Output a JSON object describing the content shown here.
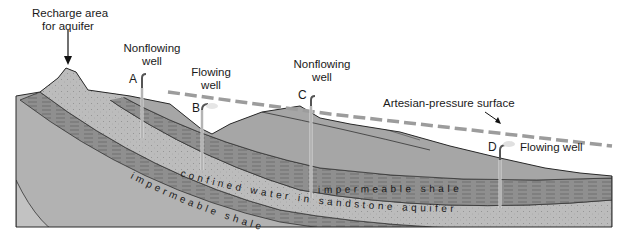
{
  "labels": {
    "recharge": "Recharge area for aquifer",
    "recharge_line1": "Recharge area",
    "recharge_line2": "for aquifer",
    "well_a_title_1": "Nonflowing",
    "well_a_title_2": "well",
    "well_b_title_1": "Flowing",
    "well_b_title_2": "well",
    "well_c_title_1": "Nonflowing",
    "well_c_title_2": "well",
    "well_d_title": "Flowing well",
    "artesian_surface": "Artesian-pressure surface",
    "confined_water": "confined water in sandstone aquifer",
    "impermeable_upper": "impermeable shale",
    "impermeable_lower": "impermeable shale"
  },
  "wells": [
    {
      "letter": "A",
      "type": "Nonflowing well"
    },
    {
      "letter": "B",
      "type": "Flowing well"
    },
    {
      "letter": "C",
      "type": "Nonflowing well"
    },
    {
      "letter": "D",
      "type": "Flowing well"
    }
  ],
  "colors": {
    "surface_fill": "#a8a8a8",
    "shale_fill": "#8e8e8e",
    "aquifer_fill": "#bdbdbd",
    "base_fill": "#b4b4b4",
    "dashed_line": "#9a9a9a",
    "outline": "#2a2a2a"
  }
}
